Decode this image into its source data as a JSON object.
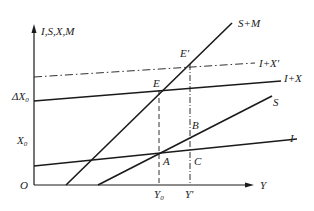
{
  "diagram": {
    "type": "economics-open-economy-equilibrium",
    "axes": {
      "y_label": "I,S,X,M",
      "x_label": "Y",
      "origin_label": "O"
    },
    "y_ticks": [
      {
        "label": "ΔX",
        "subscript": "0",
        "level": "I+X intercept"
      },
      {
        "label": "X",
        "subscript": "0",
        "level": "X0"
      }
    ],
    "x_ticks": [
      {
        "label": "Y",
        "subscript": "0"
      },
      {
        "label": "Y'",
        "subscript": ""
      }
    ],
    "curves": [
      {
        "name": "S+M",
        "style": "solid"
      },
      {
        "name": "I+X'",
        "style": "dash-dot"
      },
      {
        "name": "I+X",
        "style": "solid"
      },
      {
        "name": "S",
        "style": "solid"
      },
      {
        "name": "I",
        "style": "solid"
      }
    ],
    "points": [
      {
        "name": "E'"
      },
      {
        "name": "E"
      },
      {
        "name": "B"
      },
      {
        "name": "A"
      },
      {
        "name": "C"
      }
    ],
    "colors": {
      "line": "#1a1a1a",
      "background": "#ffffff"
    }
  }
}
